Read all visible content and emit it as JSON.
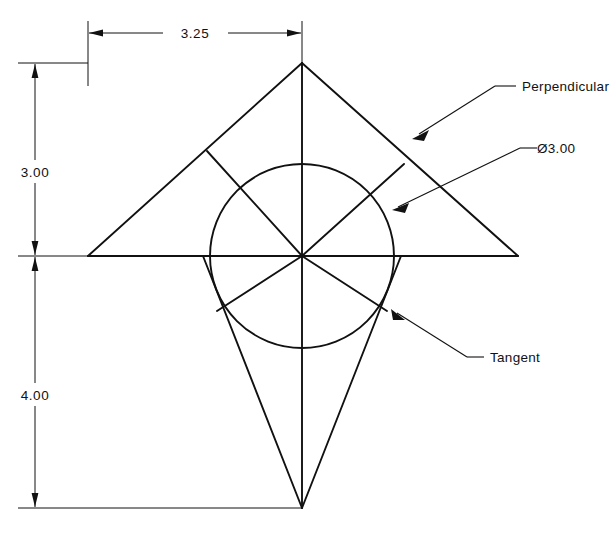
{
  "drawing": {
    "title": "Geometric construction - triangle with inscribed circle",
    "background_color": "#ffffff",
    "line_color": "#111111",
    "dimensions": [
      {
        "id": "width-3-25",
        "label": "3.25",
        "orientation": "horizontal",
        "value": 3.25,
        "units": "in",
        "position": "top"
      },
      {
        "id": "height-3-00",
        "label": "3.00",
        "orientation": "vertical",
        "value": 3.0,
        "units": "in",
        "position": "left-upper"
      },
      {
        "id": "height-4-00",
        "label": "4.00",
        "orientation": "vertical",
        "value": 4.0,
        "units": "in",
        "position": "left-lower"
      }
    ],
    "annotations": [
      {
        "id": "note-perpendicular",
        "label": "Perpendicular",
        "leader_target": "upper-right-hypotenuse"
      },
      {
        "id": "note-diameter",
        "label": "Ø3.00",
        "leader_target": "circle-edge-upper-right",
        "value": 3.0,
        "symbol": "diameter"
      },
      {
        "id": "note-tangent",
        "label": "Tangent",
        "leader_target": "circle-edge-lower-right"
      }
    ],
    "geometry": {
      "circle": {
        "center_x": 302,
        "center_y": 256,
        "radius": 92,
        "diameter_label": "Ø3.00"
      },
      "upper_triangle": {
        "apex_x": 302,
        "apex_y": 63,
        "left_x": 88,
        "left_y": 256,
        "right_x": 518,
        "right_y": 256
      },
      "lower_shape": {
        "apex_x": 302,
        "apex_y": 508
      }
    }
  }
}
